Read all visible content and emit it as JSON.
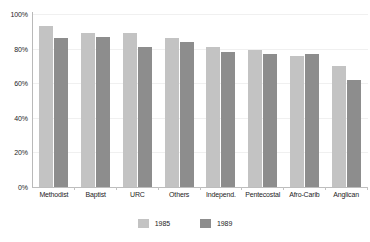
{
  "chart_data": {
    "type": "bar",
    "title": "",
    "xlabel": "",
    "ylabel": "",
    "ylim": [
      0,
      100
    ],
    "yticks": [
      0,
      20,
      40,
      60,
      80,
      100
    ],
    "ytick_labels": [
      "0%",
      "20%",
      "40%",
      "60%",
      "80%",
      "100%"
    ],
    "grid": false,
    "legend_position": "bottom-center",
    "categories": [
      "Methodist",
      "Baptist",
      "URC",
      "Others",
      "Independ.",
      "Pentecostal",
      "Afro-Carib",
      "Anglican"
    ],
    "series": [
      {
        "name": "1985",
        "color": "#c3c3c3",
        "values": [
          93,
          89,
          89,
          86,
          81,
          79,
          76,
          70
        ]
      },
      {
        "name": "1989",
        "color": "#8d8d8d",
        "values": [
          86,
          87,
          81,
          84,
          78,
          77,
          77,
          62
        ]
      }
    ]
  }
}
